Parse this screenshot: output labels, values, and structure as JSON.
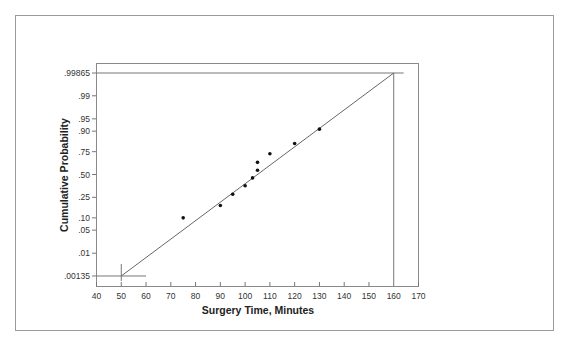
{
  "chart_data": {
    "type": "scatter",
    "subtype": "normal probability plot",
    "title": "",
    "xlabel": "Surgery Time, Minutes",
    "ylabel": "Cumulative Probability",
    "xlim": [
      40,
      170
    ],
    "x_ticks": [
      40,
      50,
      60,
      70,
      80,
      90,
      100,
      110,
      120,
      130,
      140,
      150,
      160,
      170
    ],
    "y_ticks": [
      {
        "label": ".99865",
        "p": 0.99865
      },
      {
        "label": ".99",
        "p": 0.99
      },
      {
        "label": ".95",
        "p": 0.95
      },
      {
        "label": ".90",
        "p": 0.9
      },
      {
        "label": ".75",
        "p": 0.75
      },
      {
        "label": ".50",
        "p": 0.5
      },
      {
        "label": ".25",
        "p": 0.25
      },
      {
        "label": ".10",
        "p": 0.1
      },
      {
        "label": ".05",
        "p": 0.05
      },
      {
        "label": ".01",
        "p": 0.01
      },
      {
        "label": ".00135",
        "p": 0.00135
      }
    ],
    "grid": false,
    "legend": null,
    "series": [
      {
        "name": "Surgery times",
        "x": [
          75,
          90,
          95,
          100,
          103,
          105,
          105,
          110,
          120,
          130
        ],
        "y": [
          0.1,
          0.18,
          0.28,
          0.37,
          0.46,
          0.55,
          0.64,
          0.73,
          0.82,
          0.91
        ]
      }
    ],
    "fit_line": {
      "x": [
        50,
        160
      ],
      "y": [
        0.00135,
        0.99865
      ]
    },
    "reference_lines": [
      {
        "type": "horizontal",
        "p": 0.00135,
        "x_range": [
          40,
          60
        ]
      },
      {
        "type": "vertical",
        "x": 50,
        "p_range": [
          0.00135,
          0.005
        ]
      },
      {
        "type": "horizontal",
        "p": 0.99865,
        "x_range": [
          40,
          164
        ]
      },
      {
        "type": "vertical",
        "x": 160,
        "p_range": [
          0.00135,
          0.99865
        ]
      }
    ]
  },
  "labels": {
    "xlabel": "Surgery Time, Minutes",
    "ylabel": "Cumulative Probability"
  }
}
